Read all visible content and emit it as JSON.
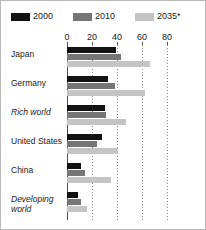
{
  "chart_data": {
    "type": "bar",
    "orientation": "horizontal",
    "title": "",
    "subtitle": "",
    "xlabel": "",
    "ylabel": "",
    "xlim": [
      0,
      104
    ],
    "xticks": [
      0,
      20,
      40,
      60,
      80
    ],
    "xtick_labels": [
      "0",
      "20",
      "40",
      "60",
      "80"
    ],
    "grid": true,
    "grid_style": "dotted-vertical",
    "legend_position": "top-left",
    "categories": [
      "Japan",
      "Germany",
      "Rich world",
      "United States",
      "China",
      "Developing world"
    ],
    "category_styles": [
      "normal",
      "normal",
      "italic",
      "normal",
      "normal",
      "italic"
    ],
    "series": [
      {
        "name": "2000",
        "color": "#121212",
        "values": [
          39,
          33,
          30,
          28,
          11,
          9
        ]
      },
      {
        "name": "2010",
        "color": "#767676",
        "values": [
          43,
          38,
          31,
          24,
          14,
          11
        ]
      },
      {
        "name": "2035*",
        "color": "#c4c4c4",
        "values": [
          66,
          62,
          47,
          41,
          35,
          16
        ]
      }
    ]
  },
  "legend": {
    "entries": [
      {
        "label": "2000",
        "color": "#121212"
      },
      {
        "label": "2010",
        "color": "#767676"
      },
      {
        "label": "2035*",
        "color": "#c4c4c4"
      }
    ]
  },
  "axis": {
    "ticks": [
      {
        "label": "0",
        "value": 0
      },
      {
        "label": "20",
        "value": 20
      },
      {
        "label": "40",
        "value": 40
      },
      {
        "label": "60",
        "value": 60
      },
      {
        "label": "80",
        "value": 80
      }
    ]
  },
  "colors": {
    "series_2000": "#121212",
    "series_2010": "#767676",
    "series_2035": "#c4c4c4",
    "axis": "#4d4d4d",
    "grid": "#8c8c8c",
    "border": "#b9b9b9",
    "text": "#1a1a1a",
    "background": "#ffffff"
  }
}
